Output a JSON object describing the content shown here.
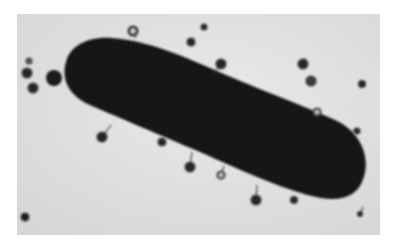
{
  "image": {
    "kind": "electron-micrograph",
    "subject": "rod-shaped bacterium with attached bacteriophage particles",
    "palette": {
      "background": "#ffffff",
      "field": "#e6e6e4",
      "cell": "#161616",
      "phage": "#2a2a2a"
    },
    "field_rect": {
      "x": 17,
      "y": 14,
      "w": 363,
      "h": 221
    },
    "phages": [
      {
        "x": 133,
        "y": 31,
        "r": 5,
        "ring": true
      },
      {
        "x": 191,
        "y": 42,
        "r": 4
      },
      {
        "x": 204,
        "y": 27,
        "r": 3
      },
      {
        "x": 221,
        "y": 64,
        "r": 5
      },
      {
        "x": 303,
        "y": 64,
        "r": 5
      },
      {
        "x": 311,
        "y": 81,
        "r": 5
      },
      {
        "x": 362,
        "y": 84,
        "r": 3.5
      },
      {
        "x": 317,
        "y": 112,
        "r": 4,
        "ring": true
      },
      {
        "x": 27,
        "y": 73,
        "r": 5
      },
      {
        "x": 33,
        "y": 88,
        "r": 5
      },
      {
        "x": 29,
        "y": 61,
        "r": 3
      },
      {
        "x": 102,
        "y": 137,
        "r": 5
      },
      {
        "x": 190,
        "y": 167,
        "r": 5
      },
      {
        "x": 221,
        "y": 175,
        "r": 4,
        "ring": true
      },
      {
        "x": 256,
        "y": 200,
        "r": 5
      },
      {
        "x": 294,
        "y": 200,
        "r": 3.5
      },
      {
        "x": 360,
        "y": 214,
        "r": 2.5
      },
      {
        "x": 25,
        "y": 217,
        "r": 4
      },
      {
        "x": 162,
        "y": 142,
        "r": 4
      },
      {
        "x": 357,
        "y": 131,
        "r": 3
      }
    ]
  }
}
